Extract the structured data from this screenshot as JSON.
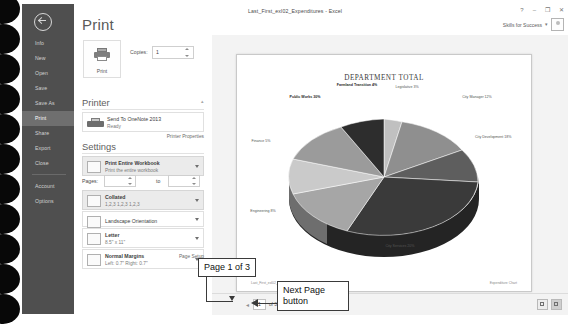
{
  "window": {
    "document_title": "Last_First_exl02_Expenditures - Excel",
    "help_icon": "?",
    "minimize_icon": "–",
    "restore_icon": "❐",
    "close_icon": "✕",
    "account_name": "Skills for Success",
    "account_caret": "▾",
    "account_icon": "user-avatar-icon"
  },
  "nav": {
    "back_icon": "back-arrow-icon",
    "items": [
      {
        "label": "Info",
        "selected": false
      },
      {
        "label": "New",
        "selected": false
      },
      {
        "label": "Open",
        "selected": false
      },
      {
        "label": "Save",
        "selected": false
      },
      {
        "label": "Save As",
        "selected": false
      },
      {
        "label": "Print",
        "selected": true
      },
      {
        "label": "Share",
        "selected": false
      },
      {
        "label": "Export",
        "selected": false
      },
      {
        "label": "Close",
        "selected": false
      },
      {
        "label": "Account",
        "selected": false
      },
      {
        "label": "Options",
        "selected": false
      }
    ]
  },
  "print": {
    "heading": "Print",
    "print_button_label": "Print",
    "print_button_icon": "printer-icon",
    "copies_label": "Copies:",
    "copies_value": "1",
    "printer_heading": "Printer",
    "printer_name": "Send To OneNote 2013",
    "printer_status": "Ready",
    "printer_icon": "printer-device-icon",
    "printer_properties_link": "Printer Properties",
    "settings_heading": "Settings",
    "collapse_icon": "collapse-icon",
    "page_setup_link": "Page Setup",
    "options": [
      {
        "name": "print-area",
        "title": "Print Entire Workbook",
        "subtitle": "Print the entire workbook",
        "icon": "sheet-icon",
        "highlighted": true
      },
      {
        "name": "collation",
        "title": "Collated",
        "subtitle": "1,2,3   1,2,3   1,2,3",
        "icon": "collate-icon",
        "highlighted": true
      },
      {
        "name": "orientation",
        "title": "Landscape Orientation",
        "subtitle": "",
        "icon": "orientation-icon",
        "highlighted": false
      },
      {
        "name": "paper-size",
        "title": "Letter",
        "subtitle": "8.5\" x 11\"",
        "icon": "paper-icon",
        "highlighted": false
      },
      {
        "name": "margins",
        "title": "Normal Margins",
        "subtitle": "Left: 0.7\"   Right: 0.7\"",
        "icon": "margins-icon",
        "highlighted": false
      }
    ],
    "pages_label": "Pages:",
    "pages_from": "",
    "pages_to_label": "to",
    "pages_to": ""
  },
  "preview": {
    "sheet_footer_left": "Last_First_exl02_Expenditures",
    "sheet_footer_right": "Expenditure Chart",
    "pager": {
      "prev_icon": "prev-page-icon",
      "current_page": "1",
      "of_total": "of 3",
      "next_icon": "next-page-icon"
    },
    "zoom": {
      "margins_button_icon": "show-margins-icon",
      "fit_page_button_icon": "zoom-to-page-icon"
    }
  },
  "callouts": [
    {
      "name": "page-indicator-callout",
      "text": "Page 1 of 3"
    },
    {
      "name": "next-page-button-callout",
      "text": "Next Page\nbutton"
    }
  ],
  "chart_data": {
    "type": "pie",
    "title": "DEPARTMENT TOTAL",
    "categories": [
      "Legislative",
      "City Manager",
      "City Development",
      "City Services",
      "Engineering",
      "Finance",
      "Public Works",
      "Farmland Transition"
    ],
    "values": [
      3,
      12,
      18,
      20,
      8,
      5,
      30,
      4
    ],
    "labels": [
      "Legislative\n3%",
      "City Manager\n12%",
      "City Development\n18%",
      "City Services\n20%",
      "Engineering\n8%",
      "Finance\n5%",
      "Public Works\n30%",
      "Farmland Transition\n4%"
    ],
    "slice_colors": [
      "#b6b6b6",
      "#8f8f8f",
      "#6a6a6a",
      "#3a3a3a",
      "#a8a8a8",
      "#c4c4c4",
      "#9b9b9b",
      "#2d2d2d"
    ],
    "legend": "none",
    "three_d": true
  }
}
